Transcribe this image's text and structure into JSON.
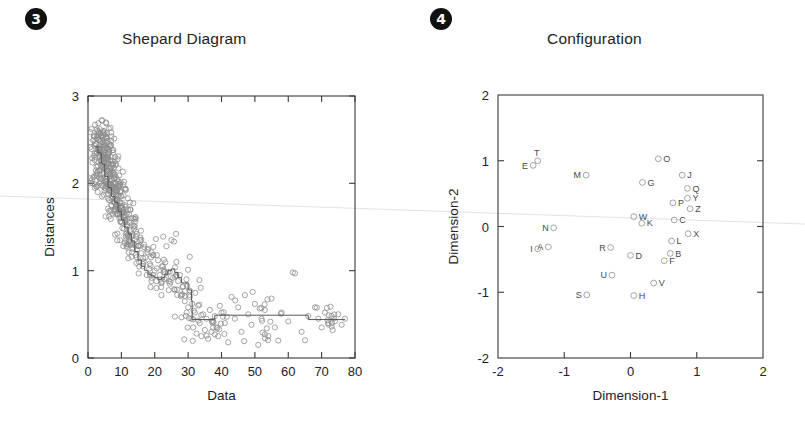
{
  "page": {
    "background": "#ffffff",
    "accent": "#111111",
    "point_color": "#8d8d8d",
    "line_color": "#555555",
    "axis_color": "#3a3a3a"
  },
  "panels": [
    {
      "marker": "❶",
      "marker_number": "3",
      "title": "Shepard Diagram"
    },
    {
      "marker": "❷",
      "marker_number": "4",
      "title": "Configuration"
    }
  ],
  "chart_data": [
    {
      "type": "scatter",
      "title": "Shepard Diagram",
      "xlabel": "Data",
      "ylabel": "Distances",
      "xlim": [
        0,
        80
      ],
      "ylim": [
        0,
        3
      ],
      "xticks": [
        0,
        10,
        20,
        30,
        40,
        50,
        60,
        70,
        80
      ],
      "yticks": [
        0,
        1,
        2,
        3
      ],
      "xtick_labels": [
        "0",
        "10",
        "20",
        "30",
        "40",
        "50",
        "60",
        "70",
        "80"
      ],
      "ytick_labels": [
        "0",
        "1",
        "2",
        "3"
      ],
      "grid": false,
      "legend": "none",
      "series": [
        {
          "name": "dissimilarity vs distance",
          "marker": "open-circle",
          "x": [
            2.0,
            2.2,
            2.4,
            2.5,
            2.6,
            2.8,
            2.9,
            3.0,
            3.0,
            3.1,
            3.2,
            3.3,
            3.4,
            3.5,
            3.6,
            3.7,
            3.8,
            3.9,
            4.0,
            4.0,
            4.1,
            4.2,
            4.3,
            4.4,
            4.5,
            4.6,
            4.7,
            4.8,
            4.9,
            5.0,
            5.0,
            5.1,
            5.2,
            5.3,
            5.4,
            5.5,
            5.6,
            5.7,
            5.8,
            5.9,
            6.0,
            6.0,
            6.1,
            6.2,
            6.3,
            6.4,
            6.5,
            6.6,
            6.7,
            6.8,
            6.9,
            7.0,
            7.0,
            7.1,
            7.2,
            7.3,
            7.4,
            7.5,
            7.6,
            7.7,
            7.8,
            7.9,
            8.0,
            8.1,
            8.2,
            8.3,
            8.4,
            8.5,
            8.6,
            8.7,
            8.8,
            8.9,
            9.0,
            9.2,
            9.4,
            9.6,
            9.8,
            10.0,
            10.2,
            10.4,
            10.6,
            10.8,
            11.0,
            11.2,
            11.4,
            11.6,
            11.8,
            12.0,
            12.2,
            12.4,
            12.6,
            12.8,
            13.0,
            13.2,
            13.5,
            13.8,
            14.0,
            14.3,
            14.6,
            15.0,
            15.3,
            15.6,
            16.0,
            16.4,
            16.8,
            17.2,
            17.6,
            18.0,
            18.5,
            19.0,
            19.5,
            20.0,
            20.5,
            21.0,
            21.5,
            22.0,
            22.5,
            23.0,
            23.5,
            24.0,
            24.5,
            25.0,
            25.5,
            26.0,
            26.5,
            27.0,
            27.5,
            28.0,
            28.5,
            29.0,
            29.5,
            30.0,
            30.5,
            31.0,
            31.2,
            31.5,
            32.0,
            32.5,
            33.0,
            33.5,
            34.0,
            34.5,
            35.0,
            35.5,
            36.0,
            36.5,
            37.0,
            37.5,
            38.0,
            38.5,
            39.0,
            40.0,
            41.0,
            42.0,
            43.0,
            44.0,
            45.0,
            46.0,
            47.0,
            48.0,
            49.0,
            50.0,
            51.0,
            52.0,
            53.0,
            54.0,
            55.0,
            56.0,
            57.0,
            58.0,
            60.0,
            62.0,
            64.0,
            66.0,
            68.0,
            69.0,
            70.0,
            71.0,
            72.0,
            73.0,
            74.0,
            75.0,
            76.0,
            77.0
          ],
          "y": [
            1.95,
            2.3,
            2.1,
            2.45,
            2.35,
            2.55,
            1.9,
            2.6,
            2.2,
            2.4,
            2.5,
            2.58,
            2.15,
            2.3,
            2.62,
            2.05,
            2.48,
            2.35,
            2.55,
            2.2,
            2.42,
            1.85,
            2.52,
            2.3,
            2.6,
            2.12,
            2.38,
            2.5,
            2.25,
            2.56,
            1.95,
            2.44,
            2.18,
            2.35,
            2.52,
            2.05,
            2.28,
            2.4,
            2.15,
            2.48,
            2.3,
            1.88,
            2.22,
            2.36,
            2.0,
            2.45,
            2.12,
            2.26,
            1.92,
            2.05,
            2.18,
            2.3,
            1.75,
            2.08,
            1.95,
            2.22,
            1.85,
            2.0,
            2.12,
            1.78,
            1.9,
            2.05,
            1.82,
            1.95,
            1.7,
            2.0,
            1.88,
            1.75,
            1.92,
            1.8,
            1.65,
            1.85,
            1.72,
            1.95,
            1.6,
            1.78,
            1.68,
            1.85,
            1.55,
            1.72,
            1.62,
            1.48,
            1.75,
            1.58,
            1.42,
            1.65,
            1.52,
            1.7,
            1.38,
            1.55,
            1.45,
            1.3,
            1.6,
            1.4,
            1.25,
            1.48,
            1.35,
            1.18,
            1.42,
            1.28,
            1.1,
            1.35,
            1.2,
            1.05,
            1.3,
            1.15,
            0.95,
            1.25,
            1.08,
            0.88,
            1.18,
            1.0,
            0.8,
            1.12,
            0.95,
            0.72,
            1.05,
            0.9,
            1.28,
            0.98,
            0.85,
            1.35,
            0.92,
            0.78,
            1.1,
            0.88,
            0.95,
            0.72,
            0.82,
            0.65,
            0.9,
            0.58,
            0.7,
            0.45,
            0.62,
            0.35,
            0.52,
            0.28,
            0.6,
            0.4,
            0.25,
            0.5,
            0.32,
            0.45,
            0.22,
            0.55,
            0.3,
            0.42,
            0.48,
            0.35,
            0.25,
            0.52,
            0.4,
            0.18,
            0.7,
            0.45,
            0.58,
            0.3,
            0.72,
            0.5,
            0.38,
            0.62,
            0.15,
            0.45,
            0.55,
            0.25,
            0.68,
            0.35,
            0.2,
            0.52,
            0.42,
            0.97,
            0.3,
            0.48,
            0.58,
            0.45,
            0.35,
            0.52,
            0.4,
            0.48,
            0.42,
            0.5,
            0.38,
            0.45,
            0.52
          ]
        }
      ],
      "step_line": {
        "name": "isotonic fit (monotone step function)",
        "x": [
          2.0,
          3.0,
          4.0,
          5.0,
          6.0,
          7.0,
          8.0,
          9.0,
          10.0,
          11.0,
          12.0,
          13.0,
          14.0,
          15.0,
          16.0,
          17.0,
          18.0,
          19.0,
          20.0,
          21.0,
          22.0,
          23.0,
          24.0,
          25.0,
          26.0,
          27.0,
          28.0,
          29.0,
          30.0,
          31.0,
          31.2,
          38.0,
          50.5,
          66.0,
          77.0
        ],
        "y": [
          2.42,
          2.35,
          2.22,
          2.08,
          1.95,
          1.85,
          1.78,
          1.68,
          1.58,
          1.5,
          1.42,
          1.34,
          1.22,
          1.12,
          1.05,
          1.0,
          0.96,
          0.94,
          0.92,
          0.9,
          0.92,
          0.96,
          1.0,
          1.02,
          0.98,
          0.92,
          0.86,
          0.86,
          0.78,
          0.66,
          0.44,
          0.49,
          0.49,
          0.44,
          0.44
        ]
      }
    },
    {
      "type": "scatter",
      "title": "Configuration",
      "xlabel": "Dimension-1",
      "ylabel": "Dimension-2",
      "xlim": [
        -2,
        2
      ],
      "ylim": [
        -2,
        2
      ],
      "xticks": [
        -2,
        -1,
        0,
        1,
        2
      ],
      "yticks": [
        -2,
        -1,
        0,
        1,
        2
      ],
      "xtick_labels": [
        "-2",
        "-1",
        "0",
        "1",
        "2"
      ],
      "ytick_labels": [
        "-2",
        "-1",
        "0",
        "1",
        "2"
      ],
      "grid": false,
      "legend": "none",
      "marker": "open-circle",
      "labelled_points": [
        {
          "label": "T",
          "x": -1.4,
          "y": 1.0,
          "label_pos": "above-left"
        },
        {
          "label": "E",
          "x": -1.47,
          "y": 0.93,
          "label_pos": "left"
        },
        {
          "label": "M",
          "x": -0.67,
          "y": 0.78,
          "label_pos": "left"
        },
        {
          "label": "O",
          "x": 0.42,
          "y": 1.03,
          "label_pos": "right"
        },
        {
          "label": "J",
          "x": 0.78,
          "y": 0.78,
          "label_pos": "right"
        },
        {
          "label": "G",
          "x": 0.18,
          "y": 0.67,
          "label_pos": "right"
        },
        {
          "label": "Q",
          "x": 0.86,
          "y": 0.58,
          "label_pos": "right"
        },
        {
          "label": "Y",
          "x": 0.86,
          "y": 0.43,
          "label_pos": "right"
        },
        {
          "label": "P",
          "x": 0.64,
          "y": 0.36,
          "label_pos": "right"
        },
        {
          "label": "Z",
          "x": 0.9,
          "y": 0.27,
          "label_pos": "right"
        },
        {
          "label": "W",
          "x": 0.05,
          "y": 0.15,
          "label_pos": "right"
        },
        {
          "label": "C",
          "x": 0.66,
          "y": 0.1,
          "label_pos": "right"
        },
        {
          "label": "K",
          "x": 0.17,
          "y": 0.05,
          "label_pos": "right"
        },
        {
          "label": "N",
          "x": -1.16,
          "y": -0.02,
          "label_pos": "left"
        },
        {
          "label": "X",
          "x": 0.87,
          "y": -0.11,
          "label_pos": "right"
        },
        {
          "label": "L",
          "x": 0.62,
          "y": -0.22,
          "label_pos": "right"
        },
        {
          "label": "A",
          "x": -1.24,
          "y": -0.31,
          "label_pos": "left"
        },
        {
          "label": "I",
          "x": -1.4,
          "y": -0.34,
          "label_pos": "left"
        },
        {
          "label": "R",
          "x": -0.3,
          "y": -0.32,
          "label_pos": "left"
        },
        {
          "label": "B",
          "x": 0.6,
          "y": -0.41,
          "label_pos": "right"
        },
        {
          "label": "D",
          "x": 0.0,
          "y": -0.44,
          "label_pos": "right"
        },
        {
          "label": "F",
          "x": 0.51,
          "y": -0.52,
          "label_pos": "right"
        },
        {
          "label": "U",
          "x": -0.28,
          "y": -0.74,
          "label_pos": "left"
        },
        {
          "label": "V",
          "x": 0.35,
          "y": -0.86,
          "label_pos": "right"
        },
        {
          "label": "S",
          "x": -0.66,
          "y": -1.04,
          "label_pos": "left"
        },
        {
          "label": "H",
          "x": 0.05,
          "y": -1.05,
          "label_pos": "right"
        }
      ]
    }
  ]
}
